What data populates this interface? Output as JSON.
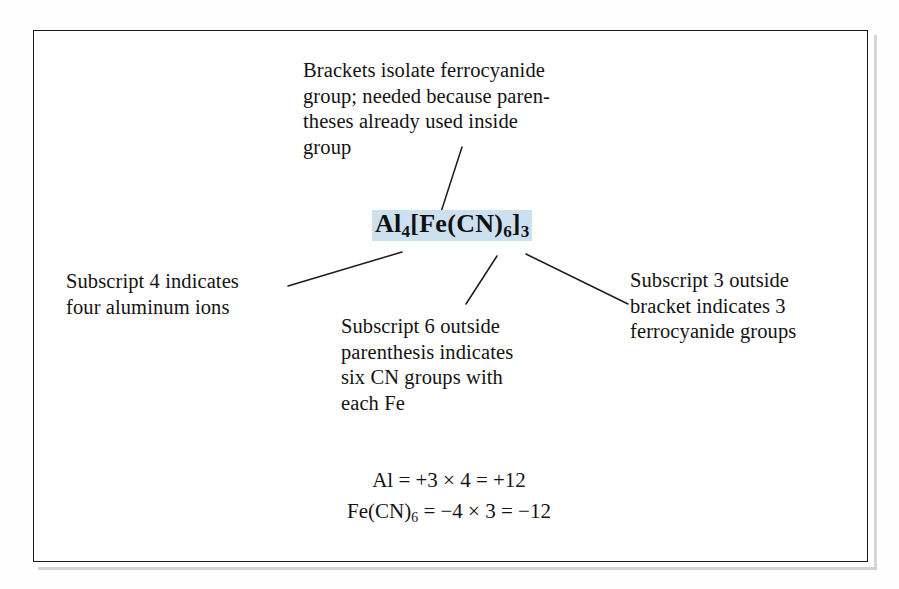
{
  "figure": {
    "kind": "annotated-chemical-formula-diagram",
    "frame": {
      "border_color": "#1b1b1d",
      "background_color": "#ffffff"
    },
    "highlight_color": "#cde0f0",
    "text_color": "#141312"
  },
  "formula": {
    "plain": "Al4[Fe(CN)6]3",
    "parts": [
      {
        "text": "Al",
        "sub": "4"
      },
      {
        "text": "[Fe(CN)",
        "sub": "6"
      },
      {
        "text": "]",
        "sub": "3"
      }
    ],
    "segment_1_main": "Al",
    "segment_1_sub": "4",
    "segment_2_main": "[Fe(CN)",
    "segment_2_sub": "6",
    "segment_3_main": "]",
    "segment_3_sub": "3"
  },
  "callouts": {
    "brackets": {
      "id": "brackets-isolate-group",
      "text": "Brackets isolate ferrocyanide\ngroup; needed because paren-\ntheses already used inside\ngroup"
    },
    "subscript4": {
      "id": "subscript-4-aluminum",
      "text": "Subscript 4 indicates\nfour aluminum ions"
    },
    "subscript6": {
      "id": "subscript-6-cn-groups",
      "text": "Subscript 6 outside\nparenthesis indicates\nsix CN groups with\neach Fe"
    },
    "subscript3": {
      "id": "subscript-3-ferrocyanide",
      "text": "Subscript 3 outside\nbracket indicates 3\nferrocyanide groups"
    }
  },
  "charge_balance": {
    "line1": {
      "species_main": "Al",
      "species_sub": "",
      "expression": " = +3 × 4 = +12"
    },
    "line2": {
      "species_main": "Fe(CN)",
      "species_sub": "6",
      "expression": " = −4 × 3 = −12"
    }
  },
  "leader_lines": [
    {
      "name": "leader-brackets-to-formula",
      "x1": 462,
      "y1": 147,
      "x2": 441,
      "y2": 212
    },
    {
      "name": "leader-subscript4-to-formula",
      "x1": 288,
      "y1": 286,
      "x2": 402,
      "y2": 252
    },
    {
      "name": "leader-subscript6-to-formula",
      "x1": 466,
      "y1": 304,
      "x2": 497,
      "y2": 256
    },
    {
      "name": "leader-subscript3-to-formula",
      "x1": 628,
      "y1": 304,
      "x2": 526,
      "y2": 254
    }
  ]
}
